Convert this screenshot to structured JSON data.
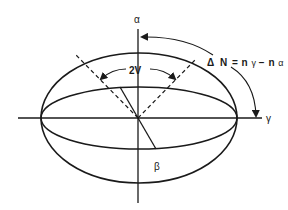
{
  "diagram": {
    "labels": {
      "alpha": "α",
      "gamma": "γ",
      "beta": "β",
      "optic_angle": "2V",
      "delta": "Δ",
      "N": "N",
      "eq": "=",
      "n1": "n",
      "sub1": "γ",
      "minus": "−",
      "n2": "n",
      "sub2": "α"
    },
    "colors": {
      "stroke": "#1a1a1a",
      "background": "#ffffff"
    }
  }
}
